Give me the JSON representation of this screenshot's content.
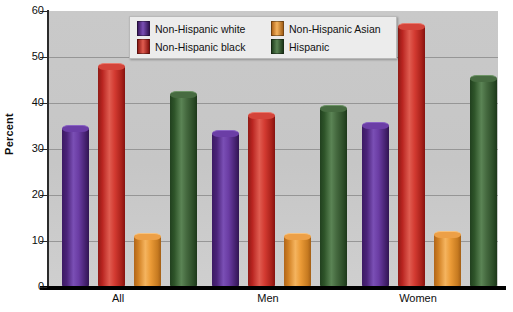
{
  "chart_data": {
    "type": "bar",
    "title": "",
    "xlabel": "",
    "ylabel": "Percent",
    "ylim": [
      0,
      60
    ],
    "yticks": [
      0,
      10,
      20,
      30,
      40,
      50,
      60
    ],
    "grid": true,
    "legend_position": "top-center",
    "categories": [
      "All",
      "Men",
      "Women"
    ],
    "series": [
      {
        "name": "Non-Hispanic white",
        "color": "#5B2D8E",
        "values": [
          34.5,
          33.5,
          35.3
        ]
      },
      {
        "name": "Non-Hispanic black",
        "color": "#CC2E2A",
        "values": [
          48.0,
          37.3,
          56.8
        ]
      },
      {
        "name": "Non-Hispanic Asian",
        "color": "#E8922E",
        "values": [
          11.0,
          11.0,
          11.5
        ]
      },
      {
        "name": "Hispanic",
        "color": "#3D6B3A",
        "values": [
          42.0,
          39.0,
          45.5
        ]
      }
    ],
    "plot_background": "#C8C8C8",
    "axis_color": "#000000"
  },
  "yaxis": {
    "title": "Percent",
    "tick_labels": [
      "60",
      "50",
      "40",
      "30",
      "20",
      "10",
      "0"
    ]
  },
  "xaxis": {
    "tick_labels": [
      "All",
      "Men",
      "Women"
    ]
  },
  "legend": {
    "items": [
      {
        "label": "Non-Hispanic white"
      },
      {
        "label": "Non-Hispanic Asian"
      },
      {
        "label": "Non-Hispanic black"
      },
      {
        "label": "Hispanic"
      }
    ]
  }
}
